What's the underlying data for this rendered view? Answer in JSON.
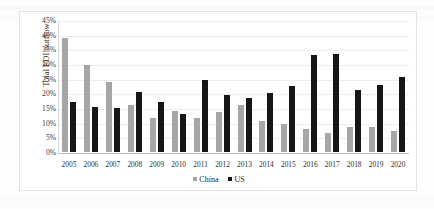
{
  "chart_data": {
    "type": "bar",
    "title": "",
    "subtitle": "",
    "xlabel": "",
    "ylabel": "Total FDI outflow",
    "ylim": [
      0,
      45
    ],
    "ytick_labels": [
      "45%",
      "40%",
      "35%",
      "30%",
      "25%",
      "20%",
      "15%",
      "10%",
      "5%",
      "0%"
    ],
    "ytick_values": [
      45,
      40,
      35,
      30,
      25,
      20,
      15,
      10,
      5,
      0
    ],
    "grid": true,
    "legend_position": "bottom-center",
    "categories": [
      "2005",
      "2006",
      "2007",
      "2008",
      "2009",
      "2010",
      "2011",
      "2012",
      "2013",
      "2014",
      "2015",
      "2016",
      "2017",
      "2018",
      "2019",
      "2020"
    ],
    "series": [
      {
        "name": "China",
        "color": "#a6a6a6",
        "values": [
          39.0,
          29.5,
          24.0,
          16.0,
          11.5,
          14.0,
          11.5,
          13.5,
          16.0,
          10.5,
          9.5,
          8.0,
          6.5,
          8.5,
          8.5,
          7.0
        ]
      },
      {
        "name": "US",
        "color": "#161616",
        "values": [
          17.0,
          15.5,
          15.0,
          20.5,
          17.0,
          13.0,
          24.5,
          19.5,
          18.5,
          20.0,
          22.5,
          33.0,
          33.5,
          21.0,
          23.0,
          25.5
        ]
      }
    ]
  },
  "legend": {
    "items": [
      {
        "label": "China",
        "color": "#a6a6a6"
      },
      {
        "label": "US",
        "color": "#161616"
      }
    ]
  },
  "axis": {
    "y_title": "Total FDI outflow"
  }
}
